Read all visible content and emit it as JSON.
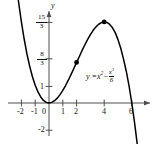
{
  "figure": {
    "kind": "cartesian-plot",
    "axis_names": {
      "y": "y",
      "x": ""
    },
    "equation_label": {
      "lhs": "y =",
      "term1_base": "x",
      "term1_exp": "2",
      "minus": "−",
      "frac_num_base": "x",
      "frac_num_exp": "3",
      "frac_den": "6"
    },
    "colors": {
      "curve": "#000000",
      "axis": "#4d4d4d",
      "point": "#000000",
      "background": "#ffffff"
    }
  },
  "chart_data": {
    "type": "line",
    "title": "",
    "xlabel": "",
    "ylabel": "y",
    "function": "y = x^2 - x^3/6",
    "grid": false,
    "legend": "none",
    "xlim": [
      -2.6,
      7.4
    ],
    "ylim": [
      -2.6,
      6.4
    ],
    "x_ticks": [
      -2,
      -1,
      0,
      1,
      2,
      4,
      6
    ],
    "x_tick_labels": [
      "-2",
      "-1",
      "0",
      "1",
      "2",
      "4",
      "6"
    ],
    "y_ticks": [
      5.3333,
      2.6667,
      1,
      -2
    ],
    "y_tick_labels": [
      "15/3",
      "8/3",
      "1",
      "-2"
    ],
    "y_tick_fracs": [
      {
        "num": "15",
        "den": "3"
      },
      {
        "num": "8",
        "den": "3"
      }
    ],
    "markers": [
      {
        "x": 2,
        "y": 2.6667,
        "label": ""
      },
      {
        "x": 4,
        "y": 5.3333,
        "label": ""
      }
    ],
    "x": [
      -2.55,
      -2.4,
      -2.2,
      -2.0,
      -1.8,
      -1.6,
      -1.4,
      -1.2,
      -1.0,
      -0.8,
      -0.6,
      -0.4,
      -0.2,
      0.0,
      0.2,
      0.4,
      0.6,
      0.8,
      1.0,
      1.2,
      1.4,
      1.6,
      1.8,
      2.0,
      2.2,
      2.4,
      2.6,
      2.8,
      3.0,
      3.2,
      3.4,
      3.6,
      3.8,
      4.0,
      4.2,
      4.4,
      4.6,
      4.8,
      5.0,
      5.2,
      5.4,
      5.6,
      5.8,
      6.0,
      6.2,
      6.4,
      6.6,
      6.8,
      7.0
    ],
    "y_values": [
      9.26,
      8.06,
      6.61,
      5.33,
      4.21,
      3.24,
      2.42,
      1.73,
      1.17,
      0.73,
      0.4,
      0.17,
      0.04,
      0.0,
      0.04,
      0.15,
      0.32,
      0.55,
      0.83,
      1.15,
      1.5,
      1.88,
      2.27,
      2.67,
      3.06,
      3.46,
      3.83,
      4.18,
      4.5,
      4.78,
      5.01,
      5.18,
      5.29,
      5.33,
      5.3,
      5.17,
      4.95,
      4.63,
      4.17,
      3.6,
      2.89,
      2.09,
      1.12,
      0.0,
      -1.29,
      -2.75,
      -4.35,
      -6.15,
      -8.17
    ]
  }
}
